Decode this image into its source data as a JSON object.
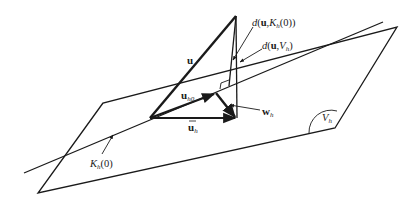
{
  "figure": {
    "type": "geometric-diagram",
    "labels": {
      "u": "u",
      "u_h0_main": "u",
      "u_h0_sub": "h0",
      "ubar_main": "u",
      "ubar_sub": "h",
      "w_main": "w",
      "w_sub": "h",
      "dK_pre": "d(",
      "dK_u": "u",
      "dK_mid": ",K",
      "dK_sub": "h",
      "dK_post": "(0))",
      "dV_pre": "d(",
      "dV_u": "u",
      "dV_mid": ",V",
      "dV_sub": "h",
      "dV_post": ")",
      "Kh0_main": "K",
      "Kh0_sub": "h",
      "Kh0_post": "(0)",
      "Vh_main": "V",
      "Vh_sub": "h"
    },
    "colors": {
      "stroke": "#1a1a1a",
      "background": "#ffffff"
    }
  }
}
